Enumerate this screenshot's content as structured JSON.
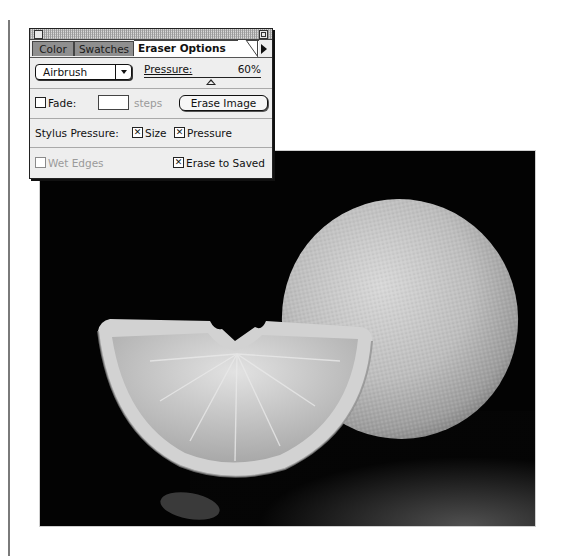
{
  "window": {
    "title": "",
    "tabs": [
      {
        "label": "Color",
        "active": false
      },
      {
        "label": "Swatches",
        "active": false
      },
      {
        "label": "Eraser Options",
        "active": true
      }
    ],
    "menu_icon": "palette-menu-arrow-icon"
  },
  "eraser_options": {
    "mode": {
      "selected": "Airbrush"
    },
    "pressure": {
      "label": "Pressure:",
      "value": "60%",
      "percent": 60
    },
    "fade": {
      "label": "Fade:",
      "value": "",
      "unit": "steps",
      "checked": false
    },
    "erase_image_label": "Erase Image",
    "stylus_pressure": {
      "label": "Stylus Pressure:",
      "size": {
        "label": "Size",
        "checked": true
      },
      "pressure": {
        "label": "Pressure",
        "checked": true
      }
    },
    "wet_edges": {
      "label": "Wet Edges",
      "checked": false,
      "disabled": true
    },
    "erase_to_saved": {
      "label": "Erase to Saved",
      "checked": true
    }
  },
  "canvas": {
    "subject": "grayscale photo of an orange wedge and a whole orange on black background",
    "colors": {
      "background": "#030303",
      "fruit_light": "#cfcfcf",
      "fruit_mid": "#9a9a9a"
    }
  }
}
